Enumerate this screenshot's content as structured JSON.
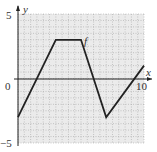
{
  "chart_data": {
    "type": "line",
    "title": "",
    "xlabel": "x",
    "ylabel": "y",
    "function_label": "f",
    "xlim": [
      0,
      10
    ],
    "ylim": [
      -5,
      5
    ],
    "grid": true,
    "x_tick_labels": [
      "0",
      "10"
    ],
    "y_tick_labels": [
      "5",
      "-5"
    ],
    "series": [
      {
        "name": "f",
        "x": [
          0,
          3,
          5,
          7,
          10
        ],
        "y": [
          -3,
          3,
          3,
          -3,
          1
        ]
      }
    ]
  },
  "labels": {
    "y5": "5",
    "yneg5": "−5",
    "x0": "0",
    "x10": "10",
    "x": "x",
    "y": "y",
    "f": "f"
  }
}
